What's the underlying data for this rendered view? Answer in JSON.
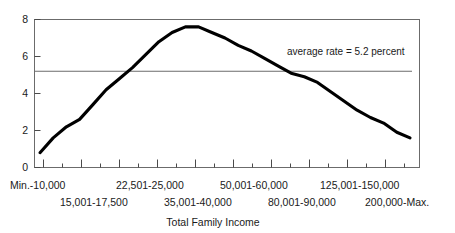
{
  "chart_data": {
    "type": "line",
    "title": "",
    "xlabel": "Total Family Income",
    "ylabel": "",
    "ylim": [
      0,
      8
    ],
    "yticks": [
      0,
      2,
      4,
      6,
      8
    ],
    "ytick_labels": [
      "0",
      "2",
      "4",
      "6",
      "8"
    ],
    "grid": false,
    "legend": "none",
    "x_index": [
      0,
      1,
      2,
      3,
      4,
      5,
      6,
      7,
      8,
      9,
      10,
      11,
      12,
      13,
      14,
      15,
      16,
      17,
      18,
      19,
      20
    ],
    "values": [
      0.8,
      1.6,
      2.2,
      2.6,
      3.4,
      4.2,
      4.8,
      5.4,
      6.1,
      6.8,
      7.3,
      7.6,
      7.6,
      7.3,
      7.0,
      6.6,
      6.3,
      5.9,
      5.5,
      5.1,
      4.9
    ],
    "values_tail": [
      4.6,
      4.1,
      3.6,
      3.1,
      2.7,
      2.4,
      1.9,
      1.6
    ],
    "series": [
      {
        "name": "rate",
        "values": [
          0.8,
          1.6,
          2.2,
          2.6,
          3.4,
          4.2,
          4.8,
          5.4,
          6.1,
          6.8,
          7.3,
          7.6,
          7.6,
          7.3,
          7.0,
          6.6,
          6.3,
          5.9,
          5.5,
          5.1,
          4.9,
          4.6,
          4.1,
          3.6,
          3.1,
          2.7,
          2.4,
          1.9,
          1.6
        ]
      }
    ],
    "xtick_categories": [
      "Min.-10,000",
      "15,001-17,500",
      "22,501-25,000",
      "35,001-40,000",
      "50,001-60,000",
      "80,001-90,000",
      "125,001-150,000",
      "200,000-Max."
    ],
    "annotations": [
      {
        "text": "average rate = 5.2 percent",
        "value": 5.2,
        "kind": "horizontal-reference-line"
      }
    ]
  },
  "axis": {
    "y_labels": [
      "8",
      "6",
      "4",
      "2",
      "0"
    ],
    "x_title": "Total Family Income"
  },
  "x_categories_top": [
    "Min.-10,000",
    "22,501-25,000",
    "50,001-60,000",
    "125,001-150,000"
  ],
  "x_categories_bottom": [
    "15,001-17,500",
    "35,001-40,000",
    "80,001-90,000",
    "200,000-Max."
  ],
  "annotation": {
    "average_rate_label": "average rate = 5.2 percent"
  },
  "colors": {
    "line": "#000000",
    "frame": "#6b6b6b",
    "reference_line": "#6b6b6b",
    "text": "#1a1a1a",
    "background": "#ffffff"
  }
}
